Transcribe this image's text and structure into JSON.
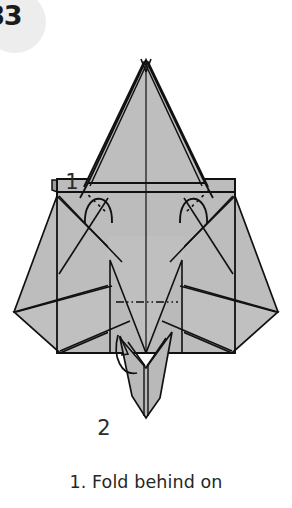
{
  "page": {
    "badge_number": "83",
    "background_color": "#ffffff",
    "badge_color": "#ededed",
    "badge_text_color": "#1b1b1b"
  },
  "caption": {
    "text": "1. Fold behind on"
  },
  "diagram": {
    "step_labels": [
      {
        "label": "1",
        "x": 72,
        "y": 143,
        "refers_to": "fold-behind arcs at upper sides"
      },
      {
        "label": "2",
        "x": 104,
        "y": 389,
        "refers_to": "valley fold at lower center tail"
      }
    ],
    "paper_fill": "#b9b9b9",
    "paper_fill_light": "#c4c4c4",
    "line_color": "#111111",
    "crease_color": "#1a1a1a",
    "fold_line_style": "dash-dot-dot",
    "annotations": {
      "left_fold_arc": "fold-behind-arc",
      "right_fold_arc": "fold-behind-arc",
      "center_crease": "fold-and-unfold line",
      "dotted_creases": "hidden edge (dotted)"
    }
  }
}
